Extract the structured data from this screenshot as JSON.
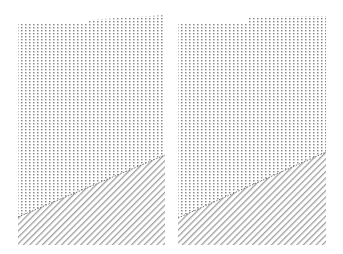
{
  "image": {
    "width": 343,
    "height": 254,
    "background": "#ffffff",
    "description": "Two side-by-side texture panels: vertical dotted lines in upper region, diagonal hatching in lower region, separated by a sloped boundary"
  },
  "colors": {
    "dots": "#6a6a6a",
    "hatch": "#9a9a9a",
    "boundary": "#555555"
  },
  "panels": [
    {
      "name": "left-panel",
      "top_polygon": [
        [
          18,
          23
        ],
        [
          88,
          23
        ],
        [
          88,
          20
        ],
        [
          165,
          15
        ],
        [
          165,
          155
        ],
        [
          18,
          217
        ]
      ],
      "bottom_polygon": [
        [
          18,
          217
        ],
        [
          165,
          155
        ],
        [
          165,
          245
        ],
        [
          18,
          245
        ]
      ],
      "x_start": 18,
      "x_end": 165
    },
    {
      "name": "right-panel",
      "top_polygon": [
        [
          178,
          24
        ],
        [
          248,
          24
        ],
        [
          248,
          17
        ],
        [
          326,
          16
        ],
        [
          326,
          152
        ],
        [
          178,
          218
        ]
      ],
      "bottom_polygon": [
        [
          178,
          218
        ],
        [
          326,
          152
        ],
        [
          326,
          245
        ],
        [
          178,
          245
        ]
      ],
      "x_start": 178,
      "x_end": 326
    }
  ],
  "pattern": {
    "vertical_spacing": 4,
    "dot_length": 1.2,
    "dot_gap": 1.6,
    "hatch_spacing": 4.5,
    "hatch_angle_deg": 45
  }
}
